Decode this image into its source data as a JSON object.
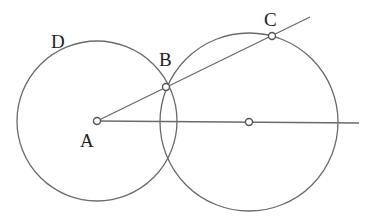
{
  "diagram": {
    "labels": {
      "A": "A",
      "B": "B",
      "C": "C",
      "D": "D"
    },
    "elements": [
      "circle centered at A passing through B (arc label D)",
      "circle centered on ray from A passing through B and C",
      "ray from A through B and C",
      "horizontal ray from A through center of second circle"
    ],
    "colors": {
      "line": "#6a6a6a",
      "text": "#222222",
      "background": "#ffffff"
    }
  }
}
